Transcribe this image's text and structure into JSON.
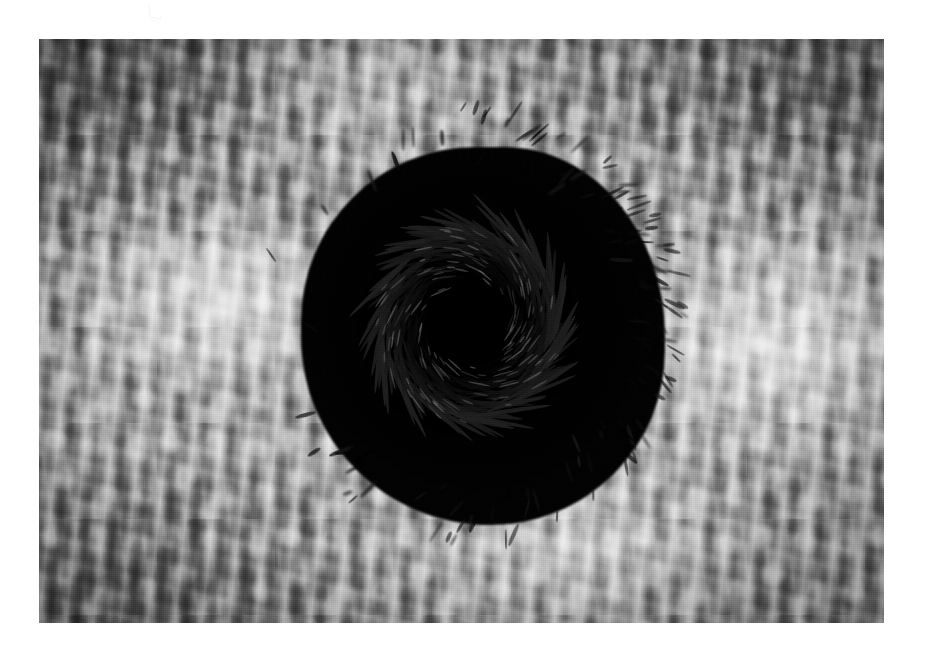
{
  "page": {
    "background_color": "#ffffff",
    "width": 933,
    "height": 660,
    "margins": {
      "left": 39,
      "top": 39,
      "right": 49,
      "bottom": 37
    }
  },
  "photograph": {
    "kind": "photograph",
    "subject": "bait ball of schooling fish over rippled sandy seabed",
    "orientation": "landscape",
    "color_mode": "black-and-white",
    "frame": {
      "x": 39,
      "y": 39,
      "width": 845,
      "height": 584
    },
    "caption": "",
    "title": "",
    "alt_text": "Aerial-style underwater photograph: a dense, near-black spherical school of small fish swirls in a vortex above a brightly lit, rippled sand seabed.",
    "palette": {
      "paper_white": "#ffffff",
      "sand_light": "#e6e6e6",
      "sand_mid": "#9c9c9c",
      "sand_dark": "#5a5a5a",
      "fish_mass": "#0d0d0d",
      "fish_core": "#000000"
    },
    "regions": {
      "seabed": {
        "label": "rippled sand seabed",
        "texture": "mottled ripple marks with overhead light caustics",
        "highlight_zones": [
          {
            "name": "left-mid glow",
            "cx_pct": 22,
            "cy_pct": 44
          },
          {
            "name": "right-mid glow",
            "cx_pct": 86,
            "cy_pct": 52
          },
          {
            "name": "lower-center glow",
            "cx_pct": 64,
            "cy_pct": 88
          }
        ],
        "shadow_zones": [
          {
            "name": "lower-left falloff",
            "cx_pct": 8,
            "cy_pct": 92
          },
          {
            "name": "upper-right falloff",
            "cx_pct": 96,
            "cy_pct": 8
          },
          {
            "name": "upper-left falloff",
            "cx_pct": 4,
            "cy_pct": 6
          }
        ]
      },
      "bait_ball": {
        "label": "bait ball",
        "shape": "ovoid vortex",
        "bounds": {
          "x": 285,
          "y": 135,
          "width": 392,
          "height": 402
        },
        "center": {
          "x": 470,
          "y": 335
        },
        "rotation_direction": "clockwise",
        "core_note": "near-black, featureless centre where fish overlap densely",
        "fringe_note": "individual fish silhouettes radiate outward, densest along the right and lower-right edge"
      }
    }
  },
  "vortex_geometry": {
    "arm_count": 46,
    "turns": 1.35,
    "r_inner_pct": 11,
    "r_outer_pct": 49,
    "streak_len_pct": 16,
    "streak_width_px": 3.1
  },
  "fringe_geometry": {
    "fish_count": 210,
    "r_min_pct": 40,
    "r_max_pct": 55,
    "fish_len_px": [
      9,
      26
    ],
    "fish_width_px": [
      2.0,
      4.2
    ],
    "angular_density_bias_deg": 20
  }
}
